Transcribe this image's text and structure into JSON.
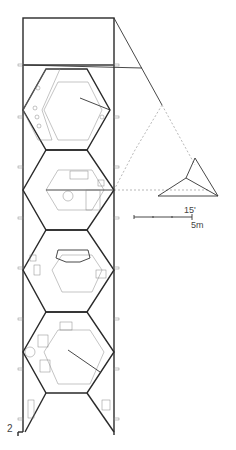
{
  "drawing": {
    "title": "Floor plan",
    "figure_number": "2",
    "scale_bar": {
      "imperial_label": "15'",
      "metric_label": "5m"
    },
    "colors": {
      "line": "#2a2a2a",
      "thin_line": "#888888",
      "background": "#ffffff"
    }
  }
}
